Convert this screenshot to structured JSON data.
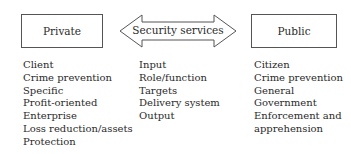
{
  "diagram": {
    "left_box": {
      "label": "Private"
    },
    "center_arrow": {
      "label": "Security services"
    },
    "right_box": {
      "label": "Public"
    },
    "private_list": [
      "Client",
      "Crime prevention",
      "Specific",
      "Profit-oriented",
      "Enterprise",
      "Loss reduction/assets",
      "Protection"
    ],
    "middle_list": [
      "Input",
      "Role/function",
      "Targets",
      "Delivery system",
      "Output"
    ],
    "public_list": [
      "Citizen",
      "Crime prevention",
      "General",
      "Government",
      "Enforcement and",
      "apprehension"
    ]
  },
  "colors": {
    "stroke": "#555555",
    "text": "#2a2a2a",
    "background": "#ffffff"
  }
}
